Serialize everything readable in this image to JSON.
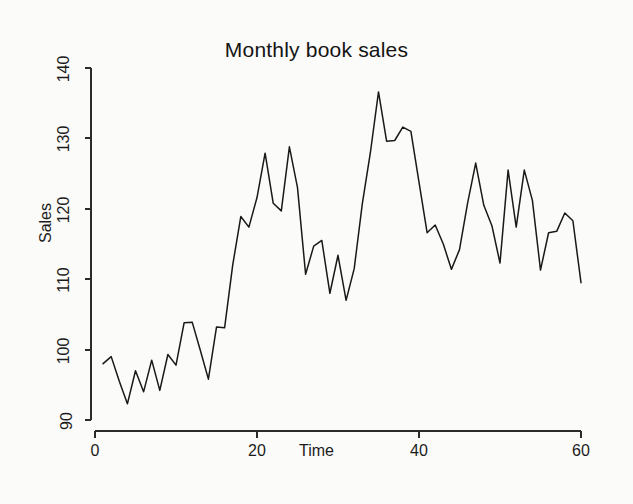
{
  "figure": {
    "background_color": "#fbfbf9",
    "line_color": "#191919",
    "axis_color": "#2b2b2b"
  },
  "chart_data": {
    "type": "line",
    "title": "Monthly book sales",
    "xlabel": "Time",
    "ylabel": "Sales",
    "xlim": [
      0,
      61
    ],
    "ylim": [
      88,
      141
    ],
    "xticks": [
      0,
      20,
      40,
      60
    ],
    "xtick_labels": [
      "0",
      "20",
      "40",
      "60"
    ],
    "yticks": [
      90,
      100,
      110,
      120,
      130,
      140
    ],
    "ytick_labels": [
      "90",
      "100",
      "110",
      "120",
      "130",
      "140"
    ],
    "grid": false,
    "legend": null,
    "series": [
      {
        "name": "Sales",
        "x": [
          1,
          2,
          3,
          4,
          5,
          6,
          7,
          8,
          9,
          10,
          11,
          12,
          13,
          14,
          15,
          16,
          17,
          18,
          19,
          20,
          21,
          22,
          23,
          24,
          25,
          26,
          27,
          28,
          29,
          30,
          31,
          32,
          33,
          34,
          35,
          36,
          37,
          38,
          39,
          40,
          41,
          42,
          43,
          44,
          45,
          46,
          47,
          48,
          49,
          50,
          51,
          52,
          53,
          54,
          55,
          56,
          57,
          58,
          59,
          60
        ],
        "values": [
          98.0,
          99.0,
          95.5,
          92.3,
          97.0,
          94.0,
          98.5,
          94.2,
          99.3,
          97.8,
          103.8,
          103.9,
          99.9,
          95.8,
          103.2,
          103.1,
          112.0,
          118.9,
          117.4,
          121.6,
          127.9,
          120.8,
          119.7,
          128.8,
          123.0,
          110.7,
          114.7,
          115.5,
          108.0,
          113.4,
          107.0,
          111.5,
          120.7,
          128.0,
          136.6,
          129.6,
          129.7,
          131.6,
          131.0,
          123.8,
          116.6,
          117.7,
          115.0,
          111.4,
          114.2,
          120.8,
          126.5,
          120.5,
          117.6,
          112.3,
          125.5,
          117.4,
          125.5,
          121.2,
          111.3,
          116.6,
          116.8,
          119.4,
          118.3,
          109.5
        ]
      }
    ]
  }
}
